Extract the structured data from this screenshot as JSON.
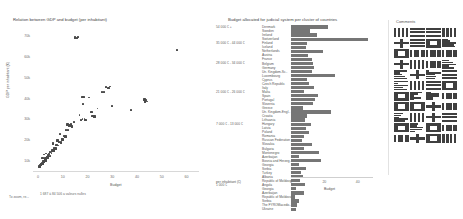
{
  "scatter": {
    "title": "Relation between GDP and budget (per inhabitant)",
    "ylabel": "GDP per inhabitant (€)",
    "xlabel": "Budget",
    "note_left": "To zoom, re...",
    "note_right_line1": "1 687 à 84 506",
    "note_right_line2": "a valeurs nulles",
    "yticks": [
      "70k",
      "60k",
      "50k",
      "40k",
      "30k",
      "20k",
      "10k"
    ],
    "xticks": [
      "0",
      "10",
      "20",
      "30",
      "40",
      "50",
      "60"
    ],
    "ylim": [
      5000,
      75000
    ],
    "xlim": [
      -2,
      65
    ]
  },
  "bars": {
    "title": "Budget allocated for judicial system per cluster of countries",
    "xlabel": "Budget",
    "ylabel_axis": "per inhabitant (€)",
    "xticks": [
      "0",
      "20",
      "40"
    ],
    "xlim": [
      0,
      48
    ],
    "clusters": [
      "54 000 € +",
      "35 000 € - 44 000 €",
      "28 000 € - 34 000 €",
      "21 000 € - 26 000 €",
      "7 000 € - 13 000 €",
      "1 000 €"
    ]
  },
  "comments": {
    "title": "Comments"
  },
  "chart_data": [
    {
      "type": "scatter",
      "title": "Relation between GDP and budget (per inhabitant)",
      "xlabel": "Budget",
      "ylabel": "GDP per inhabitant (€)",
      "xlim": [
        -2,
        65
      ],
      "ylim": [
        5000,
        75000
      ],
      "xticks": [
        0,
        10,
        20,
        30,
        40,
        50,
        60
      ],
      "yticks": [
        10000,
        20000,
        30000,
        40000,
        50000,
        60000,
        70000
      ],
      "ytick_labels": [
        "10k",
        "20k",
        "30k",
        "40k",
        "50k",
        "60k",
        "70k"
      ],
      "grid": false,
      "legend": "none",
      "points": [
        {
          "x": 15.0,
          "y": 69500
        },
        {
          "x": 15.6,
          "y": 69300
        },
        {
          "x": 16.2,
          "y": 69600
        },
        {
          "x": 56.0,
          "y": 63500
        },
        {
          "x": 27.5,
          "y": 45500
        },
        {
          "x": 28.4,
          "y": 45200
        },
        {
          "x": 29.0,
          "y": 45800
        },
        {
          "x": 26.0,
          "y": 43000
        },
        {
          "x": 26.8,
          "y": 43300
        },
        {
          "x": 18.0,
          "y": 40600
        },
        {
          "x": 18.6,
          "y": 40700
        },
        {
          "x": 20.5,
          "y": 40500
        },
        {
          "x": 43.0,
          "y": 39500
        },
        {
          "x": 43.8,
          "y": 39400
        },
        {
          "x": 43.2,
          "y": 38600
        },
        {
          "x": 44.0,
          "y": 38500
        },
        {
          "x": 18.2,
          "y": 37200
        },
        {
          "x": 37.5,
          "y": 34500
        },
        {
          "x": 22.0,
          "y": 31500
        },
        {
          "x": 22.8,
          "y": 31400
        },
        {
          "x": 18.0,
          "y": 30200
        },
        {
          "x": 18.8,
          "y": 30100
        },
        {
          "x": 17.4,
          "y": 29600
        },
        {
          "x": 19.2,
          "y": 29400
        },
        {
          "x": 12.0,
          "y": 27500
        },
        {
          "x": 12.8,
          "y": 27000
        },
        {
          "x": 13.4,
          "y": 27400
        },
        {
          "x": 11.5,
          "y": 25000
        },
        {
          "x": 12.2,
          "y": 24800
        },
        {
          "x": 10.5,
          "y": 22000
        },
        {
          "x": 11.0,
          "y": 21800
        },
        {
          "x": 9.5,
          "y": 20500
        },
        {
          "x": 10.0,
          "y": 20300
        },
        {
          "x": 8.5,
          "y": 19000
        },
        {
          "x": 9.2,
          "y": 18800
        },
        {
          "x": 7.5,
          "y": 17500
        },
        {
          "x": 8.0,
          "y": 17300
        },
        {
          "x": 6.5,
          "y": 16000
        },
        {
          "x": 7.0,
          "y": 15800
        },
        {
          "x": 5.8,
          "y": 15000
        },
        {
          "x": 6.2,
          "y": 14800
        },
        {
          "x": 5.0,
          "y": 14000
        },
        {
          "x": 5.5,
          "y": 13800
        },
        {
          "x": 4.5,
          "y": 13200
        },
        {
          "x": 4.0,
          "y": 12500
        },
        {
          "x": 4.8,
          "y": 12300
        },
        {
          "x": 3.5,
          "y": 11800
        },
        {
          "x": 3.8,
          "y": 11500
        },
        {
          "x": 3.0,
          "y": 11000
        },
        {
          "x": 3.4,
          "y": 10800
        },
        {
          "x": 2.6,
          "y": 10200
        },
        {
          "x": 2.9,
          "y": 10000
        },
        {
          "x": 2.2,
          "y": 9500
        },
        {
          "x": 2.5,
          "y": 9300
        },
        {
          "x": 2.0,
          "y": 9000
        },
        {
          "x": 1.7,
          "y": 8700
        },
        {
          "x": 1.4,
          "y": 8400
        },
        {
          "x": 1.2,
          "y": 8100
        },
        {
          "x": 1.0,
          "y": 7800
        },
        {
          "x": 0.8,
          "y": 7500
        },
        {
          "x": 0.6,
          "y": 7200
        },
        {
          "x": 1.9,
          "y": 11200
        },
        {
          "x": 2.4,
          "y": 12900
        },
        {
          "x": 3.2,
          "y": 13500
        },
        {
          "x": 6.0,
          "y": 18200
        },
        {
          "x": 7.8,
          "y": 19600
        },
        {
          "x": 9.0,
          "y": 23000
        },
        {
          "x": 13.8,
          "y": 26500
        },
        {
          "x": 14.5,
          "y": 28800
        },
        {
          "x": 16.8,
          "y": 32000
        },
        {
          "x": 21.5,
          "y": 33500
        },
        {
          "x": 24.0,
          "y": 35200
        },
        {
          "x": 30.0,
          "y": 36500
        }
      ]
    },
    {
      "type": "bar",
      "orientation": "horizontal",
      "title": "Budget allocated for judicial system per cluster of countries",
      "xlabel": "Budget",
      "ylabel": "per inhabitant (€)",
      "xlim": [
        0,
        48
      ],
      "xticks": [
        0,
        20,
        40
      ],
      "grid": false,
      "legend": "none",
      "groups": [
        {
          "cluster": "54 000 € +",
          "categories": [
            "Denmark",
            "Sweden",
            "Ireland",
            "Switzerland"
          ],
          "values": [
            22.0,
            11.5,
            15.5,
            46.0
          ]
        },
        {
          "cluster": "35 000 € - 44 000 €",
          "categories": [
            "Finland",
            "Iceland",
            "Netherlands",
            "Austria",
            "France"
          ],
          "values": [
            9.5,
            9.0,
            19.0,
            10.0,
            12.5
          ]
        },
        {
          "cluster": "28 000 € - 34 000 €",
          "categories": [
            "Belgium",
            "Germany",
            "Un. Kingdom-Sc..",
            "Luxembourg",
            "Cyprus",
            "Czech Republic",
            "Italy"
          ],
          "values": [
            13.0,
            14.0,
            12.5,
            26.5,
            9.5,
            10.5,
            14.0
          ]
        },
        {
          "cluster": "21 000 € - 26 000 €",
          "categories": [
            "Malta",
            "Spain",
            "Portugal",
            "Slovenia",
            "Greece",
            "Un. Kingdom-Engl..",
            "Croatia",
            "Lithuania"
          ],
          "values": [
            8.0,
            16.0,
            14.5,
            13.0,
            7.0,
            24.0,
            9.5,
            8.5
          ]
        },
        {
          "cluster": "7 000 € - 13 000 €",
          "categories": [
            "Hungary",
            "Latvia",
            "Poland",
            "Romania",
            "Russian Federation",
            "Slovakia",
            "Bulgaria",
            "Montenegro",
            "Azerbaijan",
            "Bosnia and Herzeg..",
            "Georgia",
            "Serbia",
            "Turkey",
            "Albania",
            "Republic of Moldova"
          ],
          "values": [
            12.0,
            9.0,
            11.0,
            7.5,
            6.5,
            12.5,
            8.0,
            16.5,
            5.0,
            18.0,
            4.5,
            9.0,
            6.0,
            7.0,
            5.5
          ]
        },
        {
          "cluster": "1 000 €",
          "categories": [
            "Angola",
            "Georgia",
            "Azerbaijan",
            "Republic of Moldova",
            "Serbia",
            "The FYROMacedo..",
            "Ukraine"
          ],
          "values": [
            8.5,
            3.0,
            7.5,
            2.5,
            4.5,
            3.5,
            3.0
          ]
        }
      ]
    }
  ]
}
